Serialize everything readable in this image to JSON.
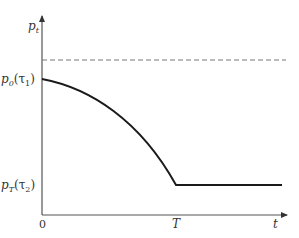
{
  "diagram": {
    "y_axis_label": "p",
    "y_axis_label_sub": "t",
    "x_axis_label": "t",
    "origin_label": "0",
    "x_tick_label": "T",
    "upper_level_label": {
      "main": "p",
      "sub": "0",
      "arg": "(τ",
      "arg_sub": "1",
      "close": ")"
    },
    "lower_level_label": {
      "main": "p",
      "sub": "T",
      "arg": "(τ",
      "arg_sub": "2",
      "close": ")"
    },
    "colors": {
      "axis": "#555555",
      "curve": "#1a1a1a",
      "dashed": "#777777",
      "text": "#333333"
    }
  }
}
